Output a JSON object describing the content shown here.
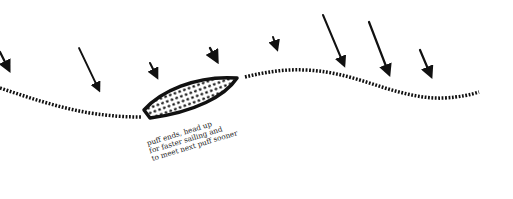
{
  "diagram": {
    "type": "sailing-tactics",
    "colors": {
      "ink": "#111111",
      "background": "#ffffff",
      "text": "#222222"
    },
    "boat": {
      "shape": "hull-hatched",
      "fill": "dotted"
    },
    "course": {
      "style": "dotted"
    },
    "wind_arrows_count": 8,
    "annotation": {
      "lines": [
        "puff ends, head up",
        "for faster sailing and",
        "to meet next puff sooner"
      ]
    }
  }
}
